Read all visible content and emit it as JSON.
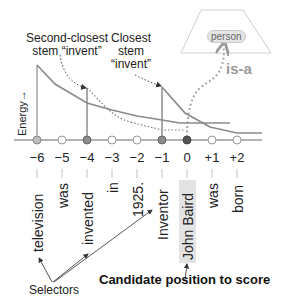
{
  "labels": {
    "second_closest_line1": "Second-closest",
    "second_closest_line2": "stem “invent”",
    "closest_line1": "Closest",
    "closest_line2": "stem",
    "closest_line3": "“invent”",
    "energy_axis": "Energy→",
    "is_a": "is-a",
    "person": "person",
    "selectors": "Selectors",
    "candidate": "Candidate position to score"
  },
  "positions": [
    {
      "offset": "−6",
      "word": "television",
      "node": "selector"
    },
    {
      "offset": "−5",
      "word": "was",
      "node": "empty"
    },
    {
      "offset": "−4",
      "word": "invented",
      "node": "stem"
    },
    {
      "offset": "−3",
      "word": "in",
      "node": "empty"
    },
    {
      "offset": "−2",
      "word": "1925.",
      "node": "empty"
    },
    {
      "offset": "−1",
      "word": "Inventor",
      "node": "stem"
    },
    {
      "offset": "0",
      "word": "John Baird",
      "node": "candidate"
    },
    {
      "offset": "+1",
      "word": "was",
      "node": "empty"
    },
    {
      "offset": "+2",
      "word": "born",
      "node": "empty"
    }
  ],
  "colors": {
    "axis": "#9a9a9a",
    "curve": "#8a8a8a",
    "node_selector": "#bdbdbd",
    "node_stem": "#8c8c8c",
    "node_candidate": "#555555",
    "node_empty": "#ffffff",
    "highlight": "#e3e3e3",
    "isa_text": "#9a9a9a"
  }
}
